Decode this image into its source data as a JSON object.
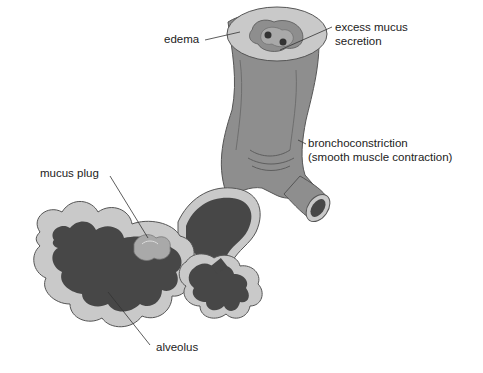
{
  "diagram": {
    "type": "anatomical-illustration",
    "colors": {
      "wall": "#8e8e8e",
      "wall_dark": "#6e6e6e",
      "wall_light": "#b7b7b7",
      "edema_layer": "#c9c9c9",
      "lumen": "#474747",
      "mucus": "#a9a9a9",
      "outline": "#555555",
      "leader_line": "#333333",
      "text": "#222222"
    },
    "labels": {
      "edema": "edema",
      "excess_mucus_line1": "excess mucus",
      "excess_mucus_line2": "secretion",
      "bronchoconstriction_line1": "bronchoconstriction",
      "bronchoconstriction_line2": "(smooth muscle contraction)",
      "mucus_plug": "mucus plug",
      "alveolus": "alveolus"
    }
  }
}
